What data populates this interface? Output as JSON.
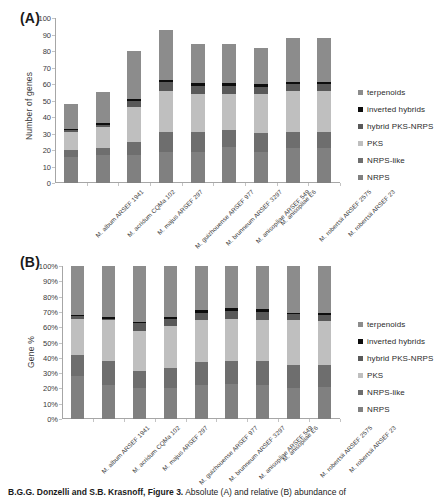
{
  "figure": {
    "caption_authors": "B.G.G. Donzelli and S.B. Krasnoff,",
    "caption_label": "Figure 3.",
    "caption_text": "Absolute (A) and relative (B) abundance of"
  },
  "legend": {
    "items": [
      {
        "label": "terpenoids",
        "color": "#8c8c8c"
      },
      {
        "label": "inverted hybrids",
        "color": "#0d0d0d"
      },
      {
        "label": "hybrid PKS-NRPS",
        "color": "#595959"
      },
      {
        "label": "PKS",
        "color": "#bfbfbf"
      },
      {
        "label": "NRPS-like",
        "color": "#6e6e6e"
      },
      {
        "label": "NRPS",
        "color": "#808080"
      }
    ]
  },
  "panel_a": {
    "letter": "(A)",
    "ylabel": "Number of genes",
    "yticks": [
      "100",
      "90",
      "80",
      "70",
      "60",
      "50",
      "40",
      "30",
      "20",
      "10",
      "0"
    ]
  },
  "panel_b": {
    "letter": "(B)",
    "ylabel": "Gene %",
    "yticks": [
      "100%",
      "90%",
      "80%",
      "70%",
      "60%",
      "50%",
      "40%",
      "30%",
      "20%",
      "10%",
      "0%"
    ]
  },
  "chart_data": [
    {
      "type": "bar",
      "stacked": true,
      "panel": "A",
      "title": "Absolute abundance of secondary metabolite genes",
      "xlabel": "",
      "ylabel": "Number of genes",
      "ylim": [
        0,
        100
      ],
      "ytick_step": 10,
      "grid": false,
      "legend_position": "right",
      "categories": [
        "M. album ARSEF 1941",
        "M. acridum CQMa 102",
        "M. majus ARSEF 297",
        "M. guizhouense ARSEF 977",
        "M. brunneum ARSEF 3297",
        "M. anisopliae ARSEF 549",
        "M. anisopliae E6",
        "M. robertsii ARSEF 2575",
        "M. robertsii ARSEF 23"
      ],
      "series": [
        {
          "name": "NRPS",
          "color": "#808080",
          "values": [
            16,
            17,
            17,
            18.5,
            18.5,
            22,
            18.5,
            21,
            21
          ]
        },
        {
          "name": "NRPS-like",
          "color": "#6e6e6e",
          "values": [
            4,
            4,
            8,
            12.5,
            12.5,
            10,
            12,
            10,
            10
          ]
        },
        {
          "name": "PKS",
          "color": "#bfbfbf",
          "values": [
            11,
            13,
            21,
            25,
            23,
            22,
            23.5,
            25,
            25
          ]
        },
        {
          "name": "hybrid PKS-NRPS",
          "color": "#595959",
          "values": [
            1,
            1,
            4,
            5,
            5,
            5,
            4.5,
            4,
            4
          ]
        },
        {
          "name": "inverted hybrids",
          "color": "#0d0d0d",
          "values": [
            1,
            1.5,
            1,
            1.5,
            1.5,
            1.5,
            1.5,
            1,
            1
          ]
        },
        {
          "name": "terpenoids",
          "color": "#8c8c8c",
          "values": [
            15,
            18.5,
            29,
            30.5,
            23.5,
            23.5,
            22,
            27,
            27
          ]
        }
      ],
      "totals": [
        48,
        55,
        80,
        93,
        84,
        84,
        82,
        88,
        88
      ]
    },
    {
      "type": "bar",
      "stacked": true,
      "normalized": true,
      "panel": "B",
      "title": "Relative abundance of secondary metabolite genes",
      "xlabel": "",
      "ylabel": "Gene %",
      "ylim": [
        0,
        100
      ],
      "ytick_step": 10,
      "grid": false,
      "legend_position": "right",
      "categories": [
        "M. album ARSEF 1941",
        "M. acridum CQMa 102",
        "M. majus ARSEF 297",
        "M. guizhouense ARSEF 977",
        "M. brunneum ARSEF 3297",
        "M. anisopliae ARSEF 549",
        "M. anisopliae E6",
        "M. robertsii ARSEF 2575",
        "M. robertsii ARSEF 23"
      ],
      "series": [
        {
          "name": "NRPS",
          "color": "#808080",
          "values": [
            28.0,
            22.0,
            20.0,
            20.0,
            22.0,
            23.0,
            22.0,
            20.5,
            21.0
          ]
        },
        {
          "name": "NRPS-like",
          "color": "#6e6e6e",
          "values": [
            14.0,
            16.0,
            11.5,
            13.5,
            15.0,
            15.0,
            16.0,
            15.0,
            14.5
          ]
        },
        {
          "name": "PKS",
          "color": "#bfbfbf",
          "values": [
            23.5,
            26.5,
            26.0,
            27.0,
            27.5,
            27.5,
            27.0,
            29.0,
            28.5
          ]
        },
        {
          "name": "hybrid PKS-NRPS",
          "color": "#595959",
          "values": [
            2.0,
            1.0,
            5.0,
            5.0,
            5.0,
            5.0,
            5.0,
            4.0,
            4.0
          ]
        },
        {
          "name": "inverted hybrids",
          "color": "#0d0d0d",
          "values": [
            0.5,
            1.5,
            1.0,
            1.5,
            2.0,
            2.0,
            2.0,
            1.0,
            1.5
          ]
        },
        {
          "name": "terpenoids",
          "color": "#8c8c8c",
          "values": [
            32.0,
            33.0,
            36.5,
            33.0,
            28.5,
            27.5,
            28.0,
            30.5,
            30.5
          ]
        }
      ]
    }
  ]
}
